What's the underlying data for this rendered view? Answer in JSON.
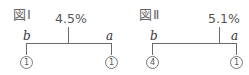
{
  "figures": [
    {
      "title": "図Ⅰ",
      "percentage": "4.5%",
      "left_label": "b",
      "right_label": "a",
      "left_count": "1",
      "right_count": "1"
    },
    {
      "title": "図Ⅱ",
      "percentage": "5.1%",
      "left_label": "b",
      "right_label": "a",
      "left_count": "4",
      "right_count": "1"
    }
  ],
  "colors": {
    "line": "#6a6a6a",
    "text": "#555555",
    "circle_border": "#777777"
  }
}
